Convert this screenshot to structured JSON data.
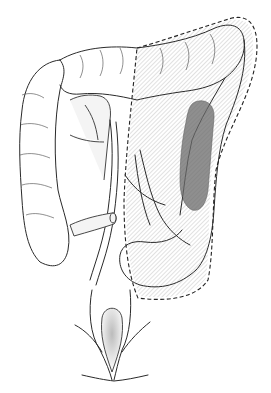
{
  "figure": {
    "title": "",
    "labels": [],
    "colors": {
      "line": "#2a2a2a",
      "hatch": "#9a9a9a",
      "diseased_segment": "#6a6a6a",
      "background": "#ffffff"
    },
    "regions": [
      {
        "name": "ascending-colon"
      },
      {
        "name": "transverse-colon"
      },
      {
        "name": "descending-colon"
      },
      {
        "name": "sigmoid-colon"
      },
      {
        "name": "rectum"
      },
      {
        "name": "resection-margin"
      },
      {
        "name": "diseased-segment"
      },
      {
        "name": "mesenteric-vessels"
      },
      {
        "name": "terminal-ileum"
      }
    ]
  }
}
